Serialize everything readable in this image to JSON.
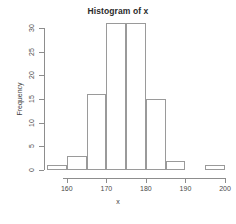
{
  "chart_data": {
    "type": "bar",
    "title": "Histogram of x",
    "xlabel": "x",
    "ylabel": "Frequency",
    "categories": [
      "155-160",
      "160-165",
      "165-170",
      "170-175",
      "175-180",
      "180-185",
      "185-190",
      "190-195",
      "195-200"
    ],
    "bin_edges": [
      155,
      160,
      165,
      170,
      175,
      180,
      185,
      190,
      195,
      200
    ],
    "values": [
      1,
      3,
      16,
      31,
      31,
      15,
      2,
      0,
      1
    ],
    "xlim": [
      155,
      200
    ],
    "ylim": [
      0,
      31
    ],
    "x_ticks": [
      160,
      170,
      180,
      190,
      200
    ],
    "x_tick_labels": [
      "160",
      "170",
      "180",
      "190",
      "200"
    ],
    "y_ticks": [
      0,
      5,
      10,
      15,
      20,
      25,
      30
    ],
    "y_tick_labels": [
      "0",
      "5",
      "10",
      "15",
      "20",
      "25",
      "30"
    ],
    "grid": false,
    "legend": false,
    "bar_fill_color": "#ffffff",
    "bar_border_color": "#9a9a9a",
    "axis_color": "#8d8d8d",
    "text_color": "#4a4a4a",
    "title_color": "#2b2b2b",
    "background_color": "#ffffff"
  }
}
